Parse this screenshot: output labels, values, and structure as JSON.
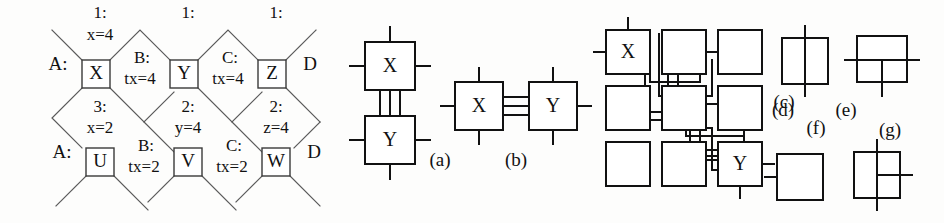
{
  "figure": {
    "background": "#fdfdfc",
    "ink": "#111111"
  },
  "lattice": {
    "row1_boxes": [
      {
        "label": "X",
        "x": 96,
        "y": 74
      },
      {
        "label": "Y",
        "x": 184,
        "y": 74
      },
      {
        "label": "Z",
        "x": 272,
        "y": 74
      }
    ],
    "row2_boxes": [
      {
        "label": "U",
        "x": 100,
        "y": 162
      },
      {
        "label": "V",
        "x": 188,
        "y": 162
      },
      {
        "label": "W",
        "x": 276,
        "y": 162
      }
    ],
    "top_labels": [
      {
        "line1": "1:",
        "line2": "x=4",
        "x": 100,
        "y": 17
      },
      {
        "line1": "1:",
        "line2": "",
        "x": 188,
        "y": 17
      },
      {
        "line1": "1:",
        "line2": "",
        "x": 276,
        "y": 17
      }
    ],
    "middle_labels": [
      {
        "line1": "3:",
        "line2": "x=2",
        "x": 100,
        "y": 109
      },
      {
        "line1": "2:",
        "line2": "y=4",
        "x": 188,
        "y": 109
      },
      {
        "line1": "2:",
        "line2": "z=4",
        "x": 276,
        "y": 109
      }
    ],
    "inline_labels_row1": [
      {
        "line1": "B:",
        "line2": "tx=4",
        "x": 142,
        "y": 62
      },
      {
        "line1": "C:",
        "line2": "tx=4",
        "x": 230,
        "y": 62
      }
    ],
    "inline_labels_row2": [
      {
        "line1": "B:",
        "line2": "tx=2",
        "x": 146,
        "y": 150
      },
      {
        "line1": "C:",
        "line2": "tx=2",
        "x": 234,
        "y": 150
      }
    ],
    "left_labels": [
      {
        "text": "A:",
        "x": 58,
        "y": 62
      },
      {
        "text": "A:",
        "x": 62,
        "y": 150
      }
    ],
    "right_labels": [
      {
        "text": "D",
        "x": 307,
        "y": 62
      },
      {
        "text": "D",
        "x": 311,
        "y": 150
      }
    ]
  },
  "diagrams": {
    "a": {
      "caption": "(a)",
      "nodes": [
        "X",
        "Y"
      ],
      "orientation": "vertical",
      "link_count": 3
    },
    "b": {
      "caption": "(b)",
      "nodes": [
        "X",
        "Y"
      ],
      "orientation": "horizontal",
      "link_count": 3
    },
    "c": {
      "caption": "(c)",
      "grid": "3x3",
      "labeled_cells": {
        "top_left": "X",
        "bottom_right": "Y"
      },
      "empty_cell_count": 7
    },
    "d": {
      "caption": "(d)",
      "desc": "square-with-vertical-through-line"
    },
    "e": {
      "caption": "(e)",
      "desc": "square-with-horizontal-through-line-and-down-stub"
    },
    "f": {
      "caption": "(f)",
      "desc": "square-with-left-stub"
    },
    "g": {
      "caption": "(g)",
      "desc": "square-with-vertical-through-line-and-right-stub"
    }
  }
}
